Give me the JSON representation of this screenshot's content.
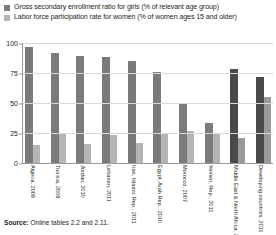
{
  "chart_data": {
    "type": "bar",
    "title": "",
    "xlabel": "",
    "ylabel": "",
    "ylim": [
      0,
      100
    ],
    "yticks": [
      0,
      25,
      50,
      75,
      100
    ],
    "grid": true,
    "legend_position": "top",
    "categories": [
      "Algeria, 2009",
      "Tunisia, 2009",
      "Jordan, 2010",
      "Lebanon, 2011",
      "Iran, Islamic Rep., 2011",
      "Egypt, Arab Rep., 2010",
      "Morocco, 2007",
      "Yemen, Rep., 2011",
      "Middle East & North Africa, 2011",
      "Developing countries, 2011"
    ],
    "series": [
      {
        "name": "Gross secondary enrollment ratio for girls (% of relevant age group)",
        "color": "#7a7a7a",
        "highlight_color": "#4a4a4a",
        "highlight_indices": [
          8,
          9
        ],
        "values": [
          97,
          92,
          89,
          88,
          85,
          76,
          50,
          33,
          78,
          72
        ]
      },
      {
        "name": "Labor force participation rate for women (% of women ages 15 and older)",
        "color": "#b5b5b5",
        "highlight_color": "#9a9a9a",
        "highlight_indices": [
          8,
          9
        ],
        "values": [
          15,
          25,
          16,
          23,
          17,
          24,
          27,
          25,
          21,
          55
        ]
      }
    ]
  },
  "legend": {
    "items": [
      {
        "label": "Gross secondary enrollment ratio for girls (% of relevant age group)",
        "color": "#7a7a7a"
      },
      {
        "label": "Labor force participation rate for women (% of women ages 15 and older)",
        "color": "#b5b5b5"
      }
    ]
  },
  "footer": {
    "source_label": "Source:",
    "source_text": " Online tables 2.2 and 2.11."
  }
}
